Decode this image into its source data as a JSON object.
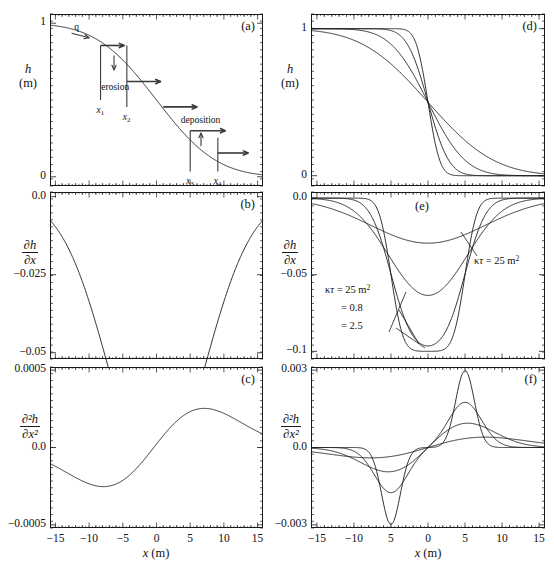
{
  "figure": {
    "width": 554,
    "height": 572,
    "background": "#ffffff",
    "line_color": "#1a1a1a",
    "annotation_color": "#3a3a3a"
  },
  "axis_titles": {
    "x_left": "x (m)",
    "x_right": "x (m)",
    "h_symbol": "h",
    "h_unit": "(m)",
    "dhdx_num": "∂h",
    "dhdx_den": "∂x",
    "d2hdx2_num": "∂²h",
    "d2hdx2_den": "∂x²"
  },
  "panels": [
    {
      "id": "a",
      "label": "(a)",
      "ylabel_kind": "h",
      "ylabel_top": "h",
      "ylabel_bottom": "(m)",
      "yticks": [
        {
          "v": 0,
          "t": "0"
        },
        {
          "v": 1,
          "t": "1"
        }
      ],
      "ylim": [
        -0.06,
        1.06
      ],
      "xlim": [
        -15.8,
        15.8
      ],
      "xticks_labeled": false,
      "annotations": {
        "flux_label": "q",
        "erosion_label": "erosion",
        "deposition_label": "deposition",
        "x1": "x",
        "x1sub": "1",
        "x2": "x",
        "x2sub": "2",
        "x3": "x",
        "x3sub": "3",
        "x4": "x",
        "x4sub": "4"
      }
    },
    {
      "id": "b",
      "label": "(b)",
      "ylabel_kind": "dhdx",
      "yticks": [
        {
          "v": 0.0,
          "t": "0.0"
        },
        {
          "v": -0.025,
          "t": "−0.025"
        },
        {
          "v": -0.05,
          "t": "−0.05"
        }
      ],
      "ylim": [
        -0.052,
        0.0015
      ],
      "xlim": [
        -15.8,
        15.8
      ],
      "xticks_labeled": false
    },
    {
      "id": "c",
      "label": "(c)",
      "ylabel_kind": "d2hdx2",
      "yticks": [
        {
          "v": 0.0005,
          "t": "0.0005"
        },
        {
          "v": 0.0,
          "t": "0.0"
        },
        {
          "v": -0.0005,
          "t": "−0.0005"
        }
      ],
      "ylim": [
        -0.00052,
        0.00052
      ],
      "xlim": [
        -15.8,
        15.8
      ],
      "xticks_labeled": true,
      "xticks": [
        {
          "v": -15,
          "t": "−15"
        },
        {
          "v": -10,
          "t": "−10"
        },
        {
          "v": -5,
          "t": "−5"
        },
        {
          "v": 0,
          "t": "0"
        },
        {
          "v": 5,
          "t": "5"
        },
        {
          "v": 10,
          "t": "10"
        },
        {
          "v": 15,
          "t": "15"
        }
      ],
      "xaxis_title": "x (m)"
    },
    {
      "id": "d",
      "label": "(d)",
      "ylabel_kind": "h",
      "ylabel_top": "h",
      "ylabel_bottom": "(m)",
      "yticks": [
        {
          "v": 0,
          "t": "0"
        },
        {
          "v": 1,
          "t": "1"
        }
      ],
      "ylim": [
        -0.07,
        1.1
      ],
      "xlim": [
        -15.8,
        15.8
      ],
      "xticks_labeled": false
    },
    {
      "id": "e",
      "label": "(e)",
      "ylabel_kind": "dhdx",
      "yticks": [
        {
          "v": 0.0,
          "t": "0.0"
        },
        {
          "v": -0.05,
          "t": "−0.05"
        },
        {
          "v": -0.1,
          "t": "−0.1"
        }
      ],
      "ylim": [
        -0.105,
        0.004
      ],
      "xlim": [
        -15.8,
        15.8
      ],
      "xticks_labeled": false,
      "annotations": {
        "left_block": [
          {
            "text": "κτ = 25 m²",
            "symbol": "kappa-tau"
          },
          {
            "text": "= 0.8"
          },
          {
            "text": "= 2.5"
          }
        ],
        "right_label": "κτ = 25 m²"
      }
    },
    {
      "id": "f",
      "label": "(f)",
      "ylabel_kind": "d2hdx2",
      "yticks": [
        {
          "v": 0.003,
          "t": "0.003"
        },
        {
          "v": 0.0,
          "t": "0.0"
        },
        {
          "v": -0.003,
          "t": "−0.003"
        }
      ],
      "ylim": [
        -0.00312,
        0.00312
      ],
      "xlim": [
        -15.8,
        15.8
      ],
      "xticks_labeled": true,
      "xticks": [
        {
          "v": -15,
          "t": "−15"
        },
        {
          "v": -10,
          "t": "−10"
        },
        {
          "v": -5,
          "t": "5"
        },
        {
          "v": 0,
          "t": "0"
        },
        {
          "v": 5,
          "t": "5"
        },
        {
          "v": 10,
          "t": "10"
        },
        {
          "v": 15,
          "t": "15"
        }
      ],
      "xaxis_title": "x (m)"
    }
  ],
  "chart_data": [
    {
      "type": "line",
      "panel": "a",
      "title": "(a)",
      "xlabel": "x (m)",
      "ylabel": "h (m)",
      "xlim": [
        -15.8,
        15.8
      ],
      "ylim": [
        -0.06,
        1.06
      ],
      "grid": false,
      "legend": null,
      "series": [
        {
          "name": "h(x), kappa*tau = 25 m^2",
          "model": "erf_profile",
          "params": {
            "h0": 1.0,
            "kappa_tau": 25.0,
            "x0": 0.0
          },
          "x": [
            -15,
            -13,
            -11,
            -9,
            -7,
            -5,
            -3,
            -1,
            1,
            3,
            5,
            7,
            9,
            11,
            13,
            15
          ],
          "y": [
            0.9987,
            0.9952,
            0.9861,
            0.9642,
            0.9192,
            0.8413,
            0.7257,
            0.6103,
            0.3897,
            0.2743,
            0.1587,
            0.0808,
            0.0359,
            0.0139,
            0.0048,
            0.0013
          ]
        }
      ],
      "annotations": [
        {
          "text": "q",
          "x": -11.5,
          "y": 0.95,
          "kind": "flux-label"
        },
        {
          "text": "erosion",
          "x": -6.0,
          "y": 0.63,
          "kind": "process-label"
        },
        {
          "text": "deposition",
          "x": 6.2,
          "y": 0.36,
          "kind": "process-label"
        },
        {
          "text": "x1",
          "x": -8.3,
          "y": 0.53,
          "kind": "position-marker"
        },
        {
          "text": "x2",
          "x": -4.4,
          "y": 0.53,
          "kind": "position-marker"
        },
        {
          "text": "x3",
          "x": 5.0,
          "y": 0.05,
          "kind": "position-marker"
        },
        {
          "text": "x4",
          "x": 9.1,
          "y": 0.05,
          "kind": "position-marker"
        }
      ]
    },
    {
      "type": "line",
      "panel": "b",
      "title": "(b)",
      "xlabel": "x (m)",
      "ylabel": "dh/dx",
      "xlim": [
        -15.8,
        15.8
      ],
      "ylim": [
        -0.052,
        0.0015
      ],
      "grid": false,
      "series": [
        {
          "name": "dh/dx, kappa*tau = 25 m^2",
          "model": "gaussian_derivative",
          "params": {
            "amplitude": -0.0456,
            "kappa_tau": 25.0,
            "x0": 0.0
          },
          "x": [
            -15,
            -13,
            -11,
            -9,
            -7,
            -5,
            -3,
            -1,
            0,
            1,
            3,
            5,
            7,
            9,
            11,
            13,
            15
          ],
          "y": [
            -0.0047,
            -0.0097,
            -0.017,
            -0.0258,
            -0.0343,
            -0.0414,
            -0.045,
            -0.0456,
            -0.0456,
            -0.0456,
            -0.045,
            -0.0414,
            -0.0343,
            -0.0258,
            -0.017,
            -0.0097,
            -0.0047
          ]
        }
      ]
    },
    {
      "type": "line",
      "panel": "c",
      "title": "(c)",
      "xlabel": "x (m)",
      "ylabel": "d2h/dx2",
      "xlim": [
        -15.8,
        15.8
      ],
      "ylim": [
        -0.00052,
        0.00052
      ],
      "grid": false,
      "series": [
        {
          "name": "d2h/dx2, kappa*tau = 25 m^2",
          "model": "gaussian_second_derivative",
          "params": {
            "kappa_tau": 25.0,
            "x0": 0.0
          },
          "x": [
            -15,
            -13,
            -11,
            -9,
            -7.5,
            -5,
            -3,
            -1,
            0,
            1,
            3,
            5,
            7.5,
            10,
            13,
            15
          ],
          "y": [
            -0.00021,
            -0.00031,
            -0.00038,
            -0.00041,
            -0.00041,
            -0.00037,
            -0.00025,
            -9e-05,
            0.0,
            9e-05,
            0.00025,
            0.00037,
            0.00041,
            0.00036,
            0.00022,
            0.00015
          ]
        }
      ]
    },
    {
      "type": "line",
      "panel": "d",
      "title": "(d)",
      "xlabel": "x (m)",
      "ylabel": "h (m)",
      "xlim": [
        -15.8,
        15.8
      ],
      "ylim": [
        -0.07,
        1.1
      ],
      "grid": false,
      "series": [
        {
          "name": "kappa*tau = 0.8 m^2",
          "kappa_tau": 0.8,
          "x": [
            -15,
            -10,
            -6,
            -4,
            -2,
            -1,
            0,
            1,
            2,
            4,
            6,
            10,
            15
          ],
          "y": [
            1.0,
            1.0,
            1.0,
            0.9999,
            0.9873,
            0.8682,
            0.5,
            0.1318,
            0.0127,
            0.0001,
            0.0,
            0.0,
            0.0
          ]
        },
        {
          "name": "kappa*tau = 2.5 m^2",
          "kappa_tau": 2.5,
          "x": [
            -15,
            -10,
            -6,
            -4,
            -2,
            -1,
            0,
            1,
            2,
            4,
            6,
            10,
            15
          ],
          "y": [
            1.0,
            1.0,
            0.9999,
            0.9957,
            0.8973,
            0.7364,
            0.5,
            0.2636,
            0.1027,
            0.0043,
            0.0001,
            0.0,
            0.0
          ]
        },
        {
          "name": "kappa*tau = 8 m^2",
          "kappa_tau": 8.0,
          "x": [
            -15,
            -10,
            -6,
            -4,
            -2,
            -1,
            0,
            1,
            2,
            4,
            6,
            10,
            15
          ],
          "y": [
            0.9999,
            0.9962,
            0.9671,
            0.9214,
            0.7602,
            0.6382,
            0.5,
            0.3618,
            0.2398,
            0.0786,
            0.0329,
            0.0038,
            0.0001
          ]
        },
        {
          "name": "kappa*tau = 25 m^2",
          "kappa_tau": 25.0,
          "x": [
            -15,
            -10,
            -6,
            -4,
            -2,
            -1,
            0,
            1,
            2,
            4,
            6,
            10,
            15
          ],
          "y": [
            0.9987,
            0.9772,
            0.9192,
            0.8413,
            0.6554,
            0.5793,
            0.5,
            0.4207,
            0.3446,
            0.2119,
            0.1151,
            0.0228,
            0.0013
          ]
        }
      ]
    },
    {
      "type": "line",
      "panel": "e",
      "title": "(e)",
      "xlabel": "x (m)",
      "ylabel": "dh/dx",
      "xlim": [
        -15.8,
        15.8
      ],
      "ylim": [
        -0.105,
        0.004
      ],
      "grid": false,
      "annotations": [
        {
          "text": "κτ = 25 m²",
          "kind": "series-label",
          "position": "left-block"
        },
        {
          "text": "= 0.8",
          "kind": "series-label",
          "position": "left-block"
        },
        {
          "text": "= 2.5",
          "kind": "series-label",
          "position": "left-block"
        },
        {
          "text": "κτ = 25 m²",
          "kind": "series-label",
          "position": "right"
        }
      ],
      "series": [
        {
          "name": "kappa*tau = 0.8 m^2",
          "kappa_tau": 0.8,
          "min_value": -0.1,
          "x": [
            -15,
            -8,
            -6,
            -5.5,
            -5,
            -4.5,
            -4,
            -2,
            0,
            2,
            4,
            4.5,
            5,
            5.5,
            6,
            8,
            15
          ],
          "y": [
            0,
            0,
            -0.0005,
            -0.006,
            -0.05,
            -0.094,
            -0.0999,
            -0.1,
            -0.1,
            -0.1,
            -0.0999,
            -0.094,
            -0.05,
            -0.006,
            -0.0005,
            0,
            0
          ]
        },
        {
          "name": "kappa*tau = 2.5 m^2",
          "kappa_tau": 2.5,
          "min_value": -0.099,
          "x": [
            -15,
            -9,
            -7,
            -6,
            -5,
            -4,
            -3,
            -1,
            0,
            1,
            3,
            4,
            5,
            6,
            7,
            9,
            15
          ],
          "y": [
            0,
            -0.0006,
            -0.008,
            -0.029,
            -0.063,
            -0.089,
            -0.097,
            -0.099,
            -0.099,
            -0.099,
            -0.097,
            -0.089,
            -0.063,
            -0.029,
            -0.008,
            -0.0006,
            0
          ]
        },
        {
          "name": "kappa*tau = 8 m^2",
          "kappa_tau": 8.0,
          "min_value": -0.0805,
          "x": [
            -15,
            -11,
            -9,
            -7,
            -6,
            -5,
            -4,
            -2,
            0,
            2,
            4,
            5,
            6,
            7,
            9,
            11,
            15
          ],
          "y": [
            -0.0002,
            -0.003,
            -0.011,
            -0.03,
            -0.044,
            -0.058,
            -0.069,
            -0.079,
            -0.0805,
            -0.079,
            -0.069,
            -0.058,
            -0.044,
            -0.03,
            -0.011,
            -0.003,
            -0.0002
          ]
        },
        {
          "name": "kappa*tau = 25 m^2",
          "kappa_tau": 25.0,
          "min_value": -0.0565,
          "x": [
            -15,
            -12,
            -9,
            -7,
            -5,
            -3,
            -1,
            0,
            1,
            3,
            5,
            7,
            9,
            12,
            15
          ],
          "y": [
            -0.0058,
            -0.0137,
            -0.0283,
            -0.039,
            -0.049,
            -0.0548,
            -0.0565,
            -0.0565,
            -0.0565,
            -0.0548,
            -0.049,
            -0.039,
            -0.0283,
            -0.0137,
            -0.0058
          ]
        }
      ]
    },
    {
      "type": "line",
      "panel": "f",
      "title": "(f)",
      "xlabel": "x (m)",
      "ylabel": "d2h/dx2",
      "xlim": [
        -15.8,
        15.8
      ],
      "ylim": [
        -0.00312,
        0.00312
      ],
      "grid": false,
      "note": "negative trough centered near x=-5, positive peak near x=+5",
      "series": [
        {
          "name": "kappa*tau = 0.8 m^2",
          "kappa_tau": 0.8,
          "peak": 0.00298,
          "trough": -0.00298,
          "x": [
            -15,
            -8,
            -6,
            -5.5,
            -5,
            -4.5,
            -4,
            -2,
            0,
            2,
            4,
            4.5,
            5,
            5.5,
            6,
            8,
            15
          ],
          "y": [
            0,
            0,
            -0.0003,
            -0.0016,
            -0.00298,
            -0.0016,
            -0.0003,
            0,
            0,
            0,
            0.0003,
            0.0016,
            0.00298,
            0.0016,
            0.0003,
            0,
            0
          ]
        },
        {
          "name": "kappa*tau = 2.5 m^2",
          "kappa_tau": 2.5,
          "peak": 0.00175,
          "trough": -0.00175,
          "x": [
            -15,
            -9,
            -7,
            -6,
            -5,
            -4,
            -3,
            -1,
            0,
            1,
            3,
            4,
            5,
            6,
            7,
            9,
            15
          ],
          "y": [
            0,
            -5e-05,
            -0.0004,
            -0.001,
            -0.00175,
            -0.001,
            -0.0004,
            -2e-05,
            0,
            2e-05,
            0.0004,
            0.001,
            0.00175,
            0.001,
            0.0004,
            5e-05,
            0
          ]
        },
        {
          "name": "kappa*tau = 8 m^2",
          "kappa_tau": 8.0,
          "peak": 0.00098,
          "trough": -0.00098,
          "x": [
            -15,
            -10,
            -8,
            -7,
            -6,
            -5,
            -4,
            -3,
            -1,
            0,
            1,
            3,
            4,
            5,
            6,
            7,
            8,
            10,
            15
          ],
          "y": [
            0,
            -8e-05,
            -0.0003,
            -0.0005,
            -0.0008,
            -0.00098,
            -0.0008,
            -0.0005,
            -8e-05,
            0,
            8e-05,
            0.0005,
            0.0008,
            0.00098,
            0.0008,
            0.0005,
            0.0003,
            8e-05,
            0
          ]
        },
        {
          "name": "kappa*tau = 25 m^2",
          "kappa_tau": 25.0,
          "peak": 0.00055,
          "trough": -0.00055,
          "x": [
            -15,
            -11,
            -9,
            -8,
            -7,
            -6,
            -5,
            -4,
            -3,
            -1,
            0,
            1,
            3,
            4,
            5,
            6,
            7,
            8,
            9,
            11,
            15
          ],
          "y": [
            -4e-05,
            -0.00014,
            -0.00028,
            -0.00037,
            -0.00045,
            -0.00052,
            -0.00055,
            -0.00052,
            -0.00043,
            -0.00013,
            0,
            0.00013,
            0.00043,
            0.00052,
            0.00055,
            0.00052,
            0.00045,
            0.00037,
            0.00028,
            0.00014,
            4e-05
          ]
        }
      ]
    }
  ]
}
